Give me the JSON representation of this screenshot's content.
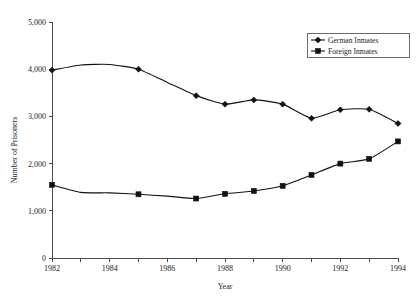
{
  "chart_data": {
    "type": "line",
    "title": "",
    "xlabel": "Year",
    "ylabel": "Number of Prisoners",
    "x": [
      1982,
      1983,
      1984,
      1985,
      1986,
      1987,
      1988,
      1989,
      1990,
      1991,
      1992,
      1993,
      1994
    ],
    "xlim": [
      1982,
      1994
    ],
    "ylim": [
      0,
      5000
    ],
    "xticks": [
      1982,
      1983,
      1984,
      1985,
      1986,
      1987,
      1988,
      1989,
      1990,
      1991,
      1992,
      1993,
      1994
    ],
    "xtick_labels": [
      "1982",
      "",
      "1984",
      "",
      "1986",
      "",
      "1988",
      "",
      "1990",
      "",
      "1992",
      "",
      "1994"
    ],
    "yticks": [
      0,
      1000,
      2000,
      3000,
      4000,
      5000
    ],
    "ytick_labels": [
      "0",
      "1,000",
      "2,000",
      "3,000",
      "4,000",
      "5,000"
    ],
    "grid": false,
    "legend_position": "top-right",
    "series": [
      {
        "name": "German Inmates",
        "marker": "diamond",
        "color": "#111111",
        "values": [
          3980,
          4090,
          4100,
          4000,
          3720,
          3440,
          3260,
          3350,
          3260,
          2960,
          3140,
          3150,
          2850
        ],
        "marker_years": [
          1982,
          1985,
          1987,
          1988,
          1989,
          1990,
          1991,
          1992,
          1993,
          1994
        ]
      },
      {
        "name": "Foreign Inmates",
        "marker": "square",
        "color": "#111111",
        "values": [
          1550,
          1390,
          1380,
          1350,
          1310,
          1260,
          1360,
          1420,
          1530,
          1760,
          2000,
          2100,
          2470
        ],
        "marker_years": [
          1982,
          1985,
          1987,
          1988,
          1989,
          1990,
          1991,
          1992,
          1993,
          1994
        ]
      }
    ]
  },
  "legend": {
    "entries": [
      {
        "label": "German Inmates"
      },
      {
        "label": "Foreign Inmates"
      }
    ]
  }
}
